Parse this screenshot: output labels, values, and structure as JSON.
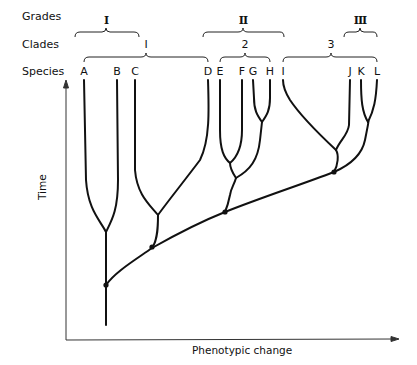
{
  "rows": {
    "grades": "Grades",
    "clades": "Clades",
    "species": "Species"
  },
  "grades": [
    {
      "label": "I",
      "x": 106
    },
    {
      "label": "II",
      "x": 243
    },
    {
      "label": "III",
      "x": 360
    }
  ],
  "clades": [
    {
      "label": "I",
      "x": 146
    },
    {
      "label": "2",
      "x": 245
    },
    {
      "label": "3",
      "x": 331
    }
  ],
  "species": [
    {
      "label": "A",
      "x": 84
    },
    {
      "label": "B",
      "x": 116
    },
    {
      "label": "C",
      "x": 134
    },
    {
      "label": "D",
      "x": 208
    },
    {
      "label": "E",
      "x": 220
    },
    {
      "label": "F",
      "x": 243
    },
    {
      "label": "G",
      "x": 253
    },
    {
      "label": "H",
      "x": 270
    },
    {
      "label": "I",
      "x": 283
    },
    {
      "label": "J",
      "x": 350
    },
    {
      "label": "K",
      "x": 361
    },
    {
      "label": "L",
      "x": 377
    }
  ],
  "axes": {
    "x_label": "Phenotypic change",
    "y_label": "Time"
  }
}
